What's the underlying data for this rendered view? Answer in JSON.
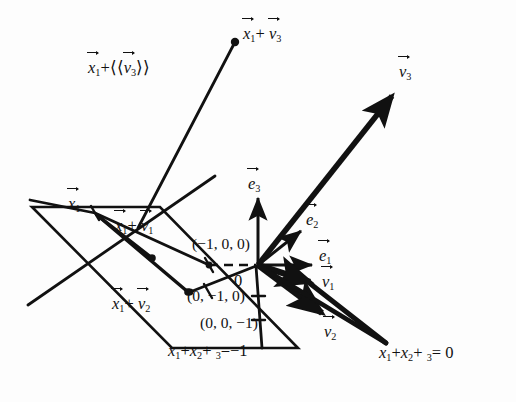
{
  "figure": {
    "ink_color": "#111111",
    "background": "#fdfdfd",
    "width": 516,
    "height": 402
  },
  "labels": {
    "x1_plus_v3_line": "+",
    "x1_plus_v3_point": "+",
    "x1_point": "",
    "x1_plus_v1": "+",
    "x1_plus_v2": "+",
    "coord_m100": "(−1, 0, 0)",
    "coord_0m10": "(0, −1, 0)",
    "coord_00m1": "(0, 0, −1)",
    "origin": "0",
    "plane_eq_left": "=−1",
    "plane_eq_right": "= 0",
    "x1_sub": "1",
    "x2_sub": "2",
    "x3_sub": "3",
    "eq_x": "x",
    "eq_plus": "+",
    "span_open": "⟨⟨",
    "span_close": "⟩⟩"
  },
  "vectors": {
    "e1": {
      "name": "e",
      "sub": "1"
    },
    "e2": {
      "name": "e",
      "sub": "2"
    },
    "e3": {
      "name": "e",
      "sub": "3"
    },
    "v1": {
      "name": "v",
      "sub": "1"
    },
    "v2": {
      "name": "v",
      "sub": "2"
    },
    "v3": {
      "name": "v",
      "sub": "3"
    },
    "x1": {
      "name": "x",
      "sub": "1"
    }
  },
  "geometry": {
    "origin": [
      258,
      265
    ],
    "x1_point": [
      95,
      213
    ],
    "x1_plus_v3_point": [
      235,
      42
    ],
    "x1_plus_v1_point": [
      152,
      258
    ],
    "x1_plus_v2_point": [
      188,
      292
    ],
    "plane_left_corners": [
      [
        32,
        207
      ],
      [
        160,
        207
      ],
      [
        298,
        348
      ],
      [
        172,
        348
      ]
    ],
    "e1_tip": [
      320,
      265
    ],
    "e2_tip": [
      305,
      228
    ],
    "e3_tip": [
      258,
      193
    ],
    "v1_tip": [
      317,
      285
    ],
    "v2_tip": [
      330,
      317
    ],
    "v3_tip": [
      398,
      88
    ],
    "far_point": [
      385,
      343
    ],
    "m100_point": [
      209,
      265
    ],
    "0m10_point": [
      208,
      291
    ]
  }
}
